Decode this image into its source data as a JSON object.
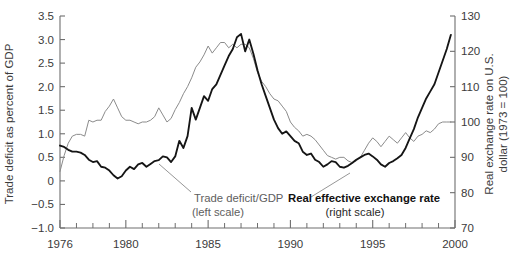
{
  "chart_data": {
    "type": "line",
    "title": "",
    "xlabel": "",
    "grid": false,
    "legend_position": "inline-annotations",
    "x_axis": {
      "min": 1976,
      "max": 2000,
      "major_ticks": [
        1976,
        1980,
        1985,
        1990,
        1995,
        2000
      ],
      "tick_labels": [
        "1976",
        "1980",
        "1985",
        "1990",
        "1995",
        "2000"
      ],
      "minor_tick_step": 1
    },
    "left_axis": {
      "label": "Trade deficit as percent of GDP",
      "min": -1.0,
      "max": 3.5,
      "step": 0.5,
      "tick_labels": [
        "3.5",
        "3.0",
        "2.5",
        "2.0",
        "1.5",
        "1.0",
        "0.5",
        "0",
        "−0.5",
        "−1.0"
      ],
      "tick_values": [
        3.5,
        3.0,
        2.5,
        2.0,
        1.5,
        1.0,
        0.5,
        0,
        -0.5,
        -1.0
      ]
    },
    "right_axis": {
      "label": "Real exchange rate on U.S. dollar (1973 = 100)",
      "min": 70,
      "max": 130,
      "step": 10,
      "tick_labels": [
        "130",
        "120",
        "110",
        "100",
        "90",
        "80",
        "70"
      ],
      "tick_values": [
        130,
        120,
        110,
        100,
        90,
        80,
        70
      ]
    },
    "series": [
      {
        "name": "Trade deficit/GDP",
        "annotation": "Trade deficit/GDP",
        "annotation_sub": "(left scale)",
        "scale": "left",
        "color": "#151515",
        "style": "thick-black",
        "x": [
          1976.0,
          1976.25,
          1976.5,
          1976.75,
          1977.0,
          1977.25,
          1977.5,
          1977.75,
          1978.0,
          1978.25,
          1978.5,
          1978.75,
          1979.0,
          1979.25,
          1979.5,
          1979.75,
          1980.0,
          1980.25,
          1980.5,
          1980.75,
          1981.0,
          1981.25,
          1981.5,
          1981.75,
          1982.0,
          1982.25,
          1982.5,
          1982.75,
          1983.0,
          1983.25,
          1983.5,
          1983.75,
          1984.0,
          1984.25,
          1984.5,
          1984.75,
          1985.0,
          1985.25,
          1985.5,
          1985.75,
          1986.0,
          1986.25,
          1986.5,
          1986.75,
          1987.0,
          1987.25,
          1987.5,
          1987.75,
          1988.0,
          1988.25,
          1988.5,
          1988.75,
          1989.0,
          1989.25,
          1989.5,
          1989.75,
          1990.0,
          1990.25,
          1990.5,
          1990.75,
          1991.0,
          1991.25,
          1991.5,
          1991.75,
          1992.0,
          1992.25,
          1992.5,
          1992.75,
          1993.0,
          1993.25,
          1993.5,
          1993.75,
          1994.0,
          1994.25,
          1994.5,
          1994.75,
          1995.0,
          1995.25,
          1995.5,
          1995.75,
          1996.0,
          1996.25,
          1996.5,
          1996.75,
          1997.0,
          1997.25,
          1997.5,
          1997.75,
          1998.0,
          1998.25,
          1998.5,
          1998.75,
          1999.0,
          1999.25,
          1999.5,
          1999.75
        ],
        "y": [
          0.75,
          0.72,
          0.66,
          0.62,
          0.62,
          0.6,
          0.55,
          0.45,
          0.4,
          0.42,
          0.3,
          0.28,
          0.22,
          0.12,
          0.05,
          0.1,
          0.22,
          0.3,
          0.25,
          0.35,
          0.38,
          0.3,
          0.36,
          0.42,
          0.44,
          0.52,
          0.5,
          0.4,
          0.52,
          0.85,
          0.7,
          0.95,
          1.55,
          1.3,
          1.55,
          1.8,
          1.7,
          1.95,
          2.05,
          2.25,
          2.45,
          2.65,
          2.8,
          3.05,
          3.12,
          2.75,
          3.0,
          2.7,
          2.35,
          2.05,
          1.8,
          1.55,
          1.3,
          1.12,
          1.0,
          1.05,
          0.95,
          0.85,
          0.8,
          0.62,
          0.55,
          0.58,
          0.45,
          0.4,
          0.3,
          0.35,
          0.42,
          0.4,
          0.3,
          0.28,
          0.32,
          0.38,
          0.45,
          0.5,
          0.55,
          0.58,
          0.52,
          0.45,
          0.35,
          0.3,
          0.38,
          0.42,
          0.48,
          0.55,
          0.7,
          0.9,
          1.1,
          1.35,
          1.55,
          1.75,
          1.9,
          2.05,
          2.3,
          2.55,
          2.8,
          3.1
        ]
      },
      {
        "name": "Real effective exchange rate",
        "annotation": "Real effective exchange rate",
        "annotation_sub": "(right scale)",
        "scale": "right",
        "color": "#8b8b8b",
        "style": "thin-gray",
        "x": [
          1976.0,
          1976.25,
          1976.5,
          1976.75,
          1977.0,
          1977.25,
          1977.5,
          1977.75,
          1978.0,
          1978.25,
          1978.5,
          1978.75,
          1979.0,
          1979.25,
          1979.5,
          1979.75,
          1980.0,
          1980.25,
          1980.5,
          1980.75,
          1981.0,
          1981.25,
          1981.5,
          1981.75,
          1982.0,
          1982.25,
          1982.5,
          1982.75,
          1983.0,
          1983.25,
          1983.5,
          1983.75,
          1984.0,
          1984.25,
          1984.5,
          1984.75,
          1985.0,
          1985.25,
          1985.5,
          1985.75,
          1986.0,
          1986.25,
          1986.5,
          1986.75,
          1987.0,
          1987.25,
          1987.5,
          1987.75,
          1988.0,
          1988.25,
          1988.5,
          1988.75,
          1989.0,
          1989.25,
          1989.5,
          1989.75,
          1990.0,
          1990.25,
          1990.5,
          1990.75,
          1991.0,
          1991.25,
          1991.5,
          1991.75,
          1992.0,
          1992.25,
          1992.5,
          1992.75,
          1993.0,
          1993.25,
          1993.5,
          1993.75,
          1994.0,
          1994.25,
          1994.5,
          1994.75,
          1995.0,
          1995.25,
          1995.5,
          1995.75,
          1996.0,
          1996.25,
          1996.5,
          1996.75,
          1997.0,
          1997.25,
          1997.5,
          1997.75,
          1998.0,
          1998.25,
          1998.5,
          1998.75,
          1999.0,
          1999.25,
          1999.5,
          1999.75
        ],
        "y": [
          86.0,
          90.5,
          94.0,
          96.0,
          96.5,
          96.5,
          96.0,
          100.5,
          100.0,
          100.5,
          100.5,
          103.0,
          104.5,
          106.5,
          104.0,
          101.5,
          100.5,
          100.5,
          100.0,
          99.5,
          100.0,
          100.0,
          100.5,
          101.5,
          104.0,
          102.0,
          100.0,
          101.0,
          103.5,
          105.5,
          108.0,
          110.0,
          112.5,
          115.5,
          117.0,
          119.0,
          121.5,
          119.5,
          121.0,
          122.5,
          122.5,
          121.0,
          122.0,
          121.0,
          122.0,
          122.0,
          121.0,
          118.0,
          114.0,
          111.5,
          110.0,
          108.0,
          106.5,
          106.0,
          104.5,
          103.0,
          100.0,
          98.5,
          97.5,
          96.0,
          96.5,
          96.0,
          95.0,
          93.5,
          92.0,
          90.5,
          90.0,
          89.5,
          90.0,
          90.0,
          89.0,
          88.5,
          89.0,
          90.0,
          92.0,
          94.0,
          95.5,
          94.5,
          93.0,
          94.5,
          96.0,
          95.0,
          94.0,
          95.5,
          97.0,
          95.5,
          94.5,
          96.0,
          96.5,
          97.5,
          97.0,
          98.0,
          99.5,
          100.0,
          100.0,
          100.0
        ]
      }
    ]
  }
}
